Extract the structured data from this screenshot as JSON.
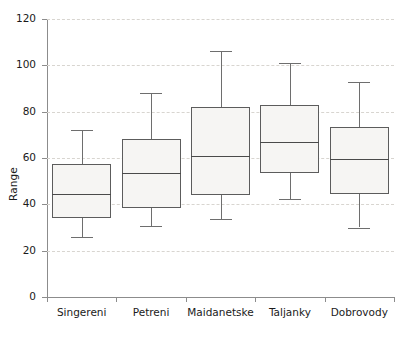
{
  "chart_data": {
    "type": "box",
    "title": "",
    "xlabel": "",
    "ylabel": "Range",
    "ylim": [
      0,
      120
    ],
    "ytick_step": 20,
    "yticks": [
      0,
      20,
      40,
      60,
      80,
      100,
      120
    ],
    "ytick_labels": [
      "0",
      "20",
      "40",
      "60",
      "80",
      "100",
      "120"
    ],
    "grid": true,
    "grid_style": "dashed-horizontal",
    "legend": null,
    "categories": [
      "Singereni",
      "Petreni",
      "Maidanetske",
      "Taljanky",
      "Dobrovody"
    ],
    "boxes": [
      {
        "category": "Singereni",
        "whisker_low": 26,
        "q1": 34,
        "median": 44.5,
        "q3": 57.5,
        "whisker_high": 72
      },
      {
        "category": "Petreni",
        "whisker_low": 30.5,
        "q1": 38.5,
        "median": 53.5,
        "q3": 68,
        "whisker_high": 88
      },
      {
        "category": "Maidanetske",
        "whisker_low": 33.5,
        "q1": 44,
        "median": 61,
        "q3": 82,
        "whisker_high": 106
      },
      {
        "category": "Taljanky",
        "whisker_low": 42.5,
        "q1": 53.5,
        "median": 67,
        "q3": 83,
        "whisker_high": 101
      },
      {
        "category": "Dobrovody",
        "whisker_low": 30,
        "q1": 44.5,
        "median": 59.5,
        "q3": 73.5,
        "whisker_high": 93
      }
    ]
  },
  "colors": {
    "box_fill": "#f6f5f3",
    "box_border": "#5c5c5c",
    "median": "#4a4a4a",
    "whisker": "#6e6e6e",
    "grid": "#d8d5d0",
    "axis": "#8c8c8c",
    "text": "#1a1a1a",
    "background": "#ffffff"
  }
}
